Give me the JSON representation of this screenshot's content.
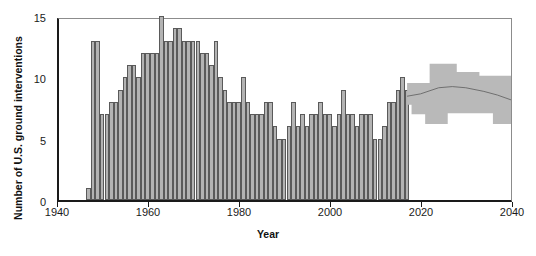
{
  "chart_data": {
    "type": "bar",
    "title": "",
    "xlabel": "Year",
    "ylabel": "Number of U.S. ground interventions",
    "xlim": [
      1940,
      2040
    ],
    "ylim": [
      0,
      15
    ],
    "xticks": [
      1940,
      1960,
      1980,
      2000,
      2020,
      2040
    ],
    "yticks": [
      0,
      5,
      10,
      15
    ],
    "grid": false,
    "legend_position": "none",
    "bar_color": "#b3b3b3",
    "bar_edge_color": "#5a5a5a",
    "band_color": "#b9b9b9",
    "line_color": "#6e6e6e",
    "axis_color": "#1a1a1a",
    "x": [
      1946,
      1947,
      1948,
      1949,
      1950,
      1951,
      1952,
      1953,
      1954,
      1955,
      1956,
      1957,
      1958,
      1959,
      1960,
      1961,
      1962,
      1963,
      1964,
      1965,
      1966,
      1967,
      1968,
      1969,
      1970,
      1971,
      1972,
      1973,
      1974,
      1975,
      1976,
      1977,
      1978,
      1979,
      1980,
      1981,
      1982,
      1983,
      1984,
      1985,
      1986,
      1987,
      1988,
      1989,
      1990,
      1991,
      1992,
      1993,
      1994,
      1995,
      1996,
      1997,
      1998,
      1999,
      2000,
      2001,
      2002,
      2003,
      2004,
      2005,
      2006,
      2007,
      2008,
      2009,
      2010,
      2011,
      2012,
      2013,
      2014,
      2015,
      2016
    ],
    "values": [
      1,
      13,
      13,
      7,
      7,
      8,
      8,
      9,
      10,
      11,
      11,
      10,
      12,
      12,
      12,
      12,
      15,
      13,
      13,
      14,
      14,
      13,
      13,
      13,
      13,
      12,
      12,
      11,
      13,
      10,
      9,
      8,
      8,
      8,
      10,
      8,
      7,
      7,
      7,
      8,
      8,
      6,
      5,
      5,
      6,
      8,
      6,
      7,
      6,
      7,
      7,
      8,
      7,
      7,
      6,
      7,
      9,
      7,
      7,
      6,
      7,
      7,
      7,
      5,
      5,
      6,
      8,
      8,
      9,
      10,
      9
    ],
    "series_note": "Annual count of U.S. ground interventions, 1946-2016",
    "projection": {
      "start_year": 2017,
      "end_year": 2040,
      "median_x": [
        2017,
        2020,
        2024,
        2027,
        2030,
        2034,
        2037,
        2040
      ],
      "median_y": [
        8.6,
        8.8,
        9.3,
        9.4,
        9.3,
        9.0,
        8.7,
        8.3
      ],
      "upper_x": [
        2017,
        2019,
        2022,
        2022,
        2028,
        2028,
        2033,
        2033,
        2040
      ],
      "upper_y": [
        9.7,
        9.7,
        9.7,
        11.3,
        11.3,
        10.6,
        10.6,
        10.3,
        10.3
      ],
      "lower_x": [
        2017,
        2018,
        2018,
        2021,
        2021,
        2026,
        2026,
        2036,
        2036,
        2040
      ],
      "lower_y": [
        7.9,
        7.9,
        7.1,
        7.1,
        6.3,
        6.3,
        7.2,
        7.2,
        6.3,
        6.3
      ]
    }
  },
  "axes": {
    "ytick_labels": [
      "0",
      "5",
      "10",
      "15"
    ],
    "xtick_labels": [
      "1940",
      "1960",
      "1980",
      "2000",
      "2020",
      "2040"
    ],
    "y_title": "Number of U.S. ground interventions",
    "x_title": "Year"
  }
}
